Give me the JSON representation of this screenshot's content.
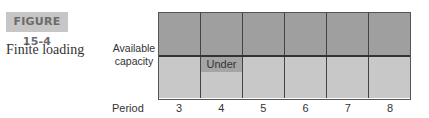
{
  "figure": {
    "number": "FIGURE 15-4",
    "title": "Finite loading"
  },
  "axis": {
    "y_label_line1": "Available",
    "y_label_line2": "capacity",
    "x_label": "Period"
  },
  "chart_data": {
    "type": "table",
    "title": "Finite loading",
    "xlabel": "Period",
    "ylabel": "Available capacity",
    "periods": [
      "3",
      "4",
      "5",
      "6",
      "7",
      "8"
    ],
    "rows": [
      "Above capacity (loaded)",
      "Below capacity line"
    ],
    "annotations": [
      {
        "period": "4",
        "text": "Under"
      }
    ]
  },
  "grid": {
    "under_text": "Under"
  },
  "colors": {
    "top_fill": "#9f9f9f",
    "bottom_fill": "#c8c8c8",
    "under_fill": "#a5a5a5",
    "label_bg": "#c6c6c6"
  }
}
